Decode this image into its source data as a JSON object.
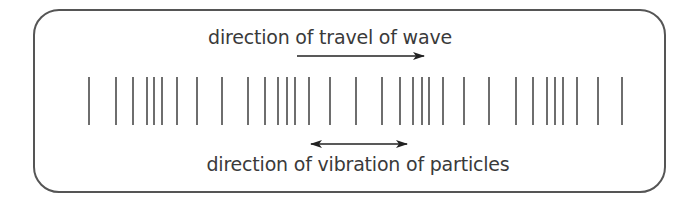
{
  "diagram": {
    "title_top": "direction of travel of wave",
    "title_bottom": "direction of vibration of particles",
    "colors": {
      "frame": "#555555",
      "lines": "#6e6e6e",
      "arrows": "#222222",
      "text": "#3a3a3a"
    },
    "travel_arrow": {
      "x1": 297,
      "x2": 424,
      "y": 56,
      "direction": "right"
    },
    "vibration_arrow": {
      "x1": 311,
      "x2": 407,
      "y": 144,
      "direction": "both"
    },
    "particle_lines": {
      "y_top": 77,
      "y_bottom": 125,
      "x_positions": [
        89,
        116,
        133,
        147,
        154,
        162,
        177,
        197,
        222,
        248,
        265,
        278,
        287,
        295,
        309,
        330,
        356,
        382,
        400,
        413,
        422,
        429,
        443,
        464,
        489,
        516,
        533,
        547,
        555,
        563,
        577,
        598,
        622
      ]
    }
  }
}
